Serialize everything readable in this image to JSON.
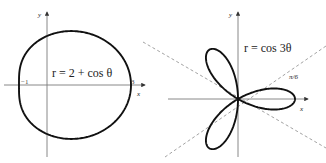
{
  "figure": {
    "panels": [
      {
        "id": "limacon",
        "equation": "r = 2 + cos θ",
        "axis_labels": {
          "x": "x",
          "y": "y"
        },
        "tick_labels": [
          "−1",
          "3"
        ]
      },
      {
        "id": "rose",
        "equation": "r = cos 3θ",
        "axis_labels": {
          "x": "x",
          "y": "y"
        },
        "guide_label": "π/6"
      }
    ]
  },
  "colors": {
    "curve": "#111111",
    "axis": "#7a7a7a",
    "guide": "#8a8a8a"
  }
}
